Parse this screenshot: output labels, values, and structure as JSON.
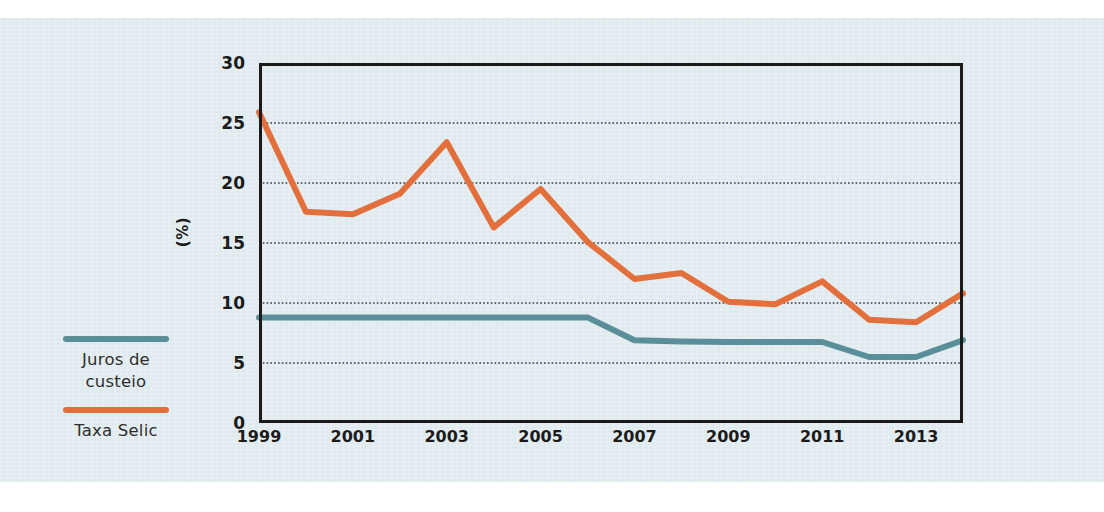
{
  "colors": {
    "background": "#dfeaef",
    "page": "#ffffff",
    "selic": "#e3703c",
    "custeio": "#5a8f99",
    "axis": "#1a1a1a",
    "text": "#1b1b1b",
    "gridline": "#3a3a3a"
  },
  "legend": {
    "items": [
      {
        "name": "juros-de-custeio",
        "label": "Juros de\ncusteio",
        "color": "#5a8f99"
      },
      {
        "name": "taxa-selic",
        "label": "Taxa Selic",
        "color": "#e3703c"
      }
    ]
  },
  "axes": {
    "y_title": "(%)",
    "y_ticks": [
      "30",
      "25",
      "20",
      "15",
      "10",
      "5",
      "0"
    ],
    "x_ticks": [
      "1999",
      "2001",
      "2003",
      "2005",
      "2007",
      "2009",
      "2011",
      "2013"
    ]
  },
  "chart_data": {
    "type": "line",
    "title": "",
    "subtitle": "",
    "xlabel": "",
    "ylabel": "(%)",
    "xlim": [
      1999,
      2014
    ],
    "ylim": [
      0,
      30
    ],
    "yticks": [
      0,
      5,
      10,
      15,
      20,
      25,
      30
    ],
    "xticks": [
      1999,
      2001,
      2003,
      2005,
      2007,
      2009,
      2011,
      2013
    ],
    "grid": "horizontal-dotted",
    "legend_position": "left-outside",
    "x": [
      1999,
      2000,
      2001,
      2002,
      2003,
      2004,
      2005,
      2006,
      2007,
      2008,
      2009,
      2010,
      2011,
      2012,
      2013,
      2014
    ],
    "series": [
      {
        "name": "Taxa Selic",
        "color": "#e3703c",
        "values": [
          25.9,
          17.6,
          17.4,
          19.1,
          23.4,
          16.3,
          19.5,
          15.1,
          12.0,
          12.5,
          10.1,
          9.9,
          11.8,
          8.6,
          8.4,
          10.8
        ]
      },
      {
        "name": "Juros de custeio",
        "color": "#5a8f99",
        "values": [
          8.8,
          8.8,
          8.8,
          8.8,
          8.8,
          8.8,
          8.8,
          8.8,
          6.9,
          6.8,
          6.75,
          6.75,
          6.75,
          5.5,
          5.5,
          6.9
        ]
      }
    ]
  }
}
